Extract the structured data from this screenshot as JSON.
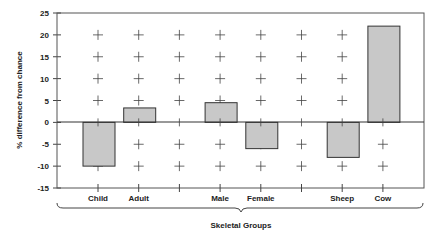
{
  "chart_data": {
    "type": "bar",
    "title": "",
    "xlabel": "Skeletal Groups",
    "ylabel": "% difference from chance",
    "ylim": [
      -15,
      25
    ],
    "yticks": [
      25,
      20,
      15,
      10,
      5,
      0,
      -5,
      -10,
      -15
    ],
    "grid": "plus-markers",
    "legend": "none",
    "categories": [
      "Child",
      "Adult",
      "",
      "Male",
      "Female",
      "",
      "Sheep",
      "Cow"
    ],
    "values": [
      -10,
      3.3,
      null,
      4.5,
      -6,
      null,
      -8,
      22
    ],
    "bar_color": "#c8c8c8",
    "bar_edge_color": "#333333"
  }
}
